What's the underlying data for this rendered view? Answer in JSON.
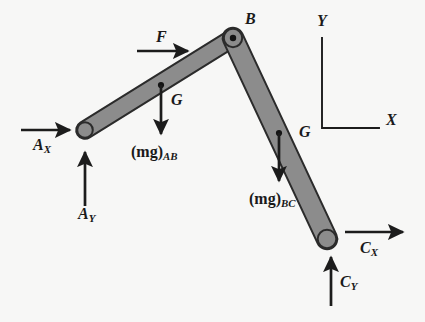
{
  "figure": {
    "background_color": "#f7f7f6",
    "link_fill_color": "#8a8a8a",
    "link_stroke_color": "#2b2b2b",
    "arrow_color": "#1c1c1c",
    "text_color": "#1a1a1a"
  },
  "links": [
    {
      "name": "link-AB",
      "from_point": "A",
      "to_point": "B",
      "start": {
        "x": 85,
        "y": 130
      },
      "end": {
        "x": 233,
        "y": 38
      },
      "thickness": 17
    },
    {
      "name": "link-BC",
      "from_point": "B",
      "to_point": "C",
      "start": {
        "x": 233,
        "y": 38
      },
      "end": {
        "x": 327,
        "y": 239
      },
      "thickness": 20
    }
  ],
  "joints": [
    {
      "name": "pin-B",
      "label": "B",
      "x": 233,
      "y": 38,
      "label_x": 245,
      "label_y": 11
    }
  ],
  "centers_of_mass": [
    {
      "name": "G-AB",
      "label": "G",
      "x": 161,
      "y": 85,
      "label_x": 171,
      "label_y": 92
    },
    {
      "name": "G-BC",
      "label": "G",
      "x": 279,
      "y": 133,
      "label_x": 299,
      "label_y": 124
    }
  ],
  "forces": [
    {
      "name": "reaction-Ax",
      "label": "A",
      "subscript": "X",
      "direction": "right",
      "tail": {
        "x": 21,
        "y": 130
      },
      "head": {
        "x": 73,
        "y": 130
      },
      "label_x": 33,
      "label_y": 137
    },
    {
      "name": "reaction-Ay",
      "label": "A",
      "subscript": "Y",
      "direction": "up",
      "tail": {
        "x": 85,
        "y": 206
      },
      "head": {
        "x": 85,
        "y": 149
      },
      "label_x": 78,
      "label_y": 206
    },
    {
      "name": "applied-force-F",
      "label": "F",
      "subscript": "",
      "direction": "right",
      "tail": {
        "x": 137,
        "y": 51
      },
      "head": {
        "x": 191,
        "y": 51
      },
      "label_x": 156,
      "label_y": 29
    },
    {
      "name": "weight-AB",
      "label": "(mg)",
      "subscript": "AB",
      "direction": "down",
      "tail": {
        "x": 161,
        "y": 85
      },
      "head": {
        "x": 161,
        "y": 137
      },
      "label_x": 131,
      "label_y": 144
    },
    {
      "name": "weight-BC",
      "label": "(mg)",
      "subscript": "BC",
      "direction": "down",
      "tail": {
        "x": 279,
        "y": 133
      },
      "head": {
        "x": 279,
        "y": 184
      },
      "label_x": 249,
      "label_y": 191
    },
    {
      "name": "reaction-Cx",
      "label": "C",
      "subscript": "X",
      "direction": "right",
      "tail": {
        "x": 345,
        "y": 232
      },
      "head": {
        "x": 406,
        "y": 232
      },
      "label_x": 360,
      "label_y": 240
    },
    {
      "name": "reaction-Cy",
      "label": "C",
      "subscript": "Y",
      "direction": "up",
      "tail": {
        "x": 331,
        "y": 306
      },
      "head": {
        "x": 331,
        "y": 254
      },
      "label_x": 340,
      "label_y": 274
    }
  ],
  "axes": {
    "name": "coordinate-axes",
    "corner": {
      "x": 322,
      "y": 128
    },
    "y_top": 38,
    "x_right": 379,
    "y_label": "Y",
    "x_label": "X",
    "y_label_x": 317,
    "y_label_y": 13,
    "x_label_x": 386,
    "x_label_y": 112
  }
}
